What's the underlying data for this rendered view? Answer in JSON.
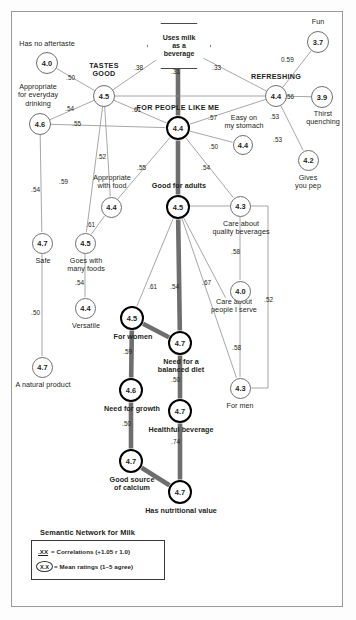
{
  "title": "Semantic Network for Milk",
  "legend": {
    "title": "Semantic Network for Milk",
    "row1_key": ".XX",
    "row1_text": "= Correlations (+1.05  r   1.0)",
    "row2_key": "X.X",
    "row2_text": "= Mean ratings (1–5 agree)"
  },
  "chart_data": {
    "type": "diagram",
    "title": "Semantic Network for Milk",
    "diagram_kind": "semantic-network",
    "value_scale": "Mean ratings (1–5 agree)",
    "edge_scale": "Correlations",
    "nodes": [
      {
        "id": "uses_milk_beverage",
        "label": "Uses milk\nas a\nbeverage",
        "value": "",
        "shape": "hexagon",
        "x": 178,
        "y": 45,
        "emphasis": "hex"
      },
      {
        "id": "has_no_aftertaste",
        "label": "Has no aftertaste",
        "value": "4.0",
        "shape": "circle",
        "x": 47,
        "y": 63,
        "emphasis": "thin",
        "label_pos": "above"
      },
      {
        "id": "tastes_good",
        "label": "TASTES\nGOOD",
        "value": "4.5",
        "shape": "circle",
        "x": 104,
        "y": 96,
        "emphasis": "thin",
        "label_pos": "above",
        "caps": true
      },
      {
        "id": "appropriate_everyday",
        "label": "Appropriate\nfor everyday\ndrinking",
        "value": "4.6",
        "shape": "circle",
        "x": 40,
        "y": 124,
        "emphasis": "thin",
        "label_pos": "above"
      },
      {
        "id": "for_people_like_me",
        "label": "FOR PEOPLE LIKE ME",
        "value": "4.4",
        "shape": "circle",
        "x": 178,
        "y": 128,
        "emphasis": "thick",
        "label_pos": "above",
        "caps": true
      },
      {
        "id": "refreshing",
        "label": "REFRESHING",
        "value": "4.4",
        "shape": "circle",
        "x": 276,
        "y": 96,
        "emphasis": "thin",
        "label_pos": "above",
        "caps": true
      },
      {
        "id": "fun",
        "label": "Fun",
        "value": "3.7",
        "shape": "circle",
        "x": 318,
        "y": 42,
        "emphasis": "thin",
        "label_pos": "above"
      },
      {
        "id": "thirst_quenching",
        "label": "Thirst\nquenching",
        "value": "3.9",
        "shape": "circle",
        "x": 322,
        "y": 97,
        "emphasis": "thin",
        "label_pos": "below"
      },
      {
        "id": "easy_on_stomach",
        "label": "Easy on\nmy stomach",
        "value": "4.4",
        "shape": "circle",
        "x": 243,
        "y": 145,
        "emphasis": "thin",
        "label_pos": "above"
      },
      {
        "id": "gives_you_pep",
        "label": "Gives\nyou pep",
        "value": "4.2",
        "shape": "circle",
        "x": 308,
        "y": 160,
        "emphasis": "thin",
        "label_pos": "below"
      },
      {
        "id": "appropriate_with_food",
        "label": "Appropriate\nwith food",
        "value": "4.4",
        "shape": "circle",
        "x": 111,
        "y": 207,
        "emphasis": "thin",
        "label_pos": "above"
      },
      {
        "id": "good_for_adults",
        "label": "Good for adults",
        "value": "4.5",
        "shape": "circle",
        "x": 178,
        "y": 207,
        "emphasis": "thick",
        "label_pos": "above"
      },
      {
        "id": "care_quality_beverages",
        "label": "Care about\nquality beverages",
        "value": "4.3",
        "shape": "circle",
        "x": 240,
        "y": 206,
        "emphasis": "thin",
        "label_pos": "below"
      },
      {
        "id": "safe",
        "label": "Safe",
        "value": "4.7",
        "shape": "circle",
        "x": 42,
        "y": 243,
        "emphasis": "thin",
        "label_pos": "below"
      },
      {
        "id": "goes_with_many_foods",
        "label": "Goes with\nmany foods",
        "value": "4.5",
        "shape": "circle",
        "x": 85,
        "y": 243,
        "emphasis": "thin",
        "label_pos": "below"
      },
      {
        "id": "versatile",
        "label": "Versatile",
        "value": "4.4",
        "shape": "circle",
        "x": 85,
        "y": 308,
        "emphasis": "thin",
        "label_pos": "below"
      },
      {
        "id": "a_natural_product",
        "label": "A natural product",
        "value": "4.7",
        "shape": "circle",
        "x": 42,
        "y": 367,
        "emphasis": "thin",
        "label_pos": "below"
      },
      {
        "id": "for_women",
        "label": "For women",
        "value": "4.5",
        "shape": "circle",
        "x": 132,
        "y": 318,
        "emphasis": "thick",
        "label_pos": "below"
      },
      {
        "id": "need_balanced_diet",
        "label": "Need for a\nbalanced diet",
        "value": "4.7",
        "shape": "circle",
        "x": 180,
        "y": 343,
        "emphasis": "thick",
        "label_pos": "below"
      },
      {
        "id": "care_people_i_serve",
        "label": "Care about\npeople I serve",
        "value": "",
        "shape": "text",
        "x": 232,
        "y": 310
      },
      {
        "id": "need_for_growth",
        "label": "Need for growth",
        "value": "4.6",
        "shape": "circle",
        "x": 131,
        "y": 390,
        "emphasis": "thick",
        "label_pos": "below"
      },
      {
        "id": "healthful_beverage",
        "label": "Healthful beverage",
        "value": "4.7",
        "shape": "circle",
        "x": 180,
        "y": 411,
        "emphasis": "thick",
        "label_pos": "below"
      },
      {
        "id": "for_men",
        "label": "For men",
        "value": "4.3",
        "shape": "circle",
        "x": 240,
        "y": 388,
        "emphasis": "thin",
        "label_pos": "below"
      },
      {
        "id": "right_4_0",
        "label": "",
        "value": "4.0",
        "shape": "circle",
        "x": 240,
        "y": 291,
        "emphasis": "thin"
      },
      {
        "id": "good_source_calcium",
        "label": "Good source\nof calcium",
        "value": "4.7",
        "shape": "circle",
        "x": 131,
        "y": 461,
        "emphasis": "thick",
        "label_pos": "below"
      },
      {
        "id": "has_nutritional_value",
        "label": "Has nutritional value",
        "value": "4.7",
        "shape": "circle",
        "x": 180,
        "y": 492,
        "emphasis": "thick",
        "label_pos": "below"
      }
    ],
    "edges": [
      {
        "from": "uses_milk_beverage",
        "to": "for_people_like_me",
        "weight": ".31",
        "style": "heavy"
      },
      {
        "from": "uses_milk_beverage",
        "to": "tastes_good",
        "weight": ".38",
        "style": "thin"
      },
      {
        "from": "uses_milk_beverage",
        "to": "refreshing",
        "weight": ".33",
        "style": "thin"
      },
      {
        "from": "has_no_aftertaste",
        "to": "tastes_good",
        "weight": ".50",
        "style": "thin"
      },
      {
        "from": "appropriate_everyday",
        "to": "tastes_good",
        "weight": ".54",
        "style": "thin"
      },
      {
        "from": "tastes_good",
        "to": "for_people_like_me",
        "weight": ".61",
        "style": "thin"
      },
      {
        "from": "appropriate_everyday",
        "to": "for_people_like_me",
        "weight": ".55",
        "style": "thin"
      },
      {
        "from": "tastes_good",
        "to": "refreshing",
        "weight": ".57",
        "style": "thin"
      },
      {
        "from": "refreshing",
        "to": "fun",
        "weight": "0.59",
        "style": "thin"
      },
      {
        "from": "refreshing",
        "to": "thirst_quenching",
        "weight": ".56",
        "style": "thin"
      },
      {
        "from": "refreshing",
        "to": "for_people_like_me",
        "weight": ".53",
        "style": "thin"
      },
      {
        "from": "refreshing",
        "to": "gives_you_pep",
        "weight": ".53",
        "style": "thin"
      },
      {
        "from": "for_people_like_me",
        "to": "easy_on_stomach",
        "weight": ".50",
        "style": "thin"
      },
      {
        "from": "for_people_like_me",
        "to": "appropriate_with_food",
        "weight": ".55",
        "style": "thin"
      },
      {
        "from": "for_people_like_me",
        "to": "good_for_adults",
        "weight": "",
        "style": "heavy"
      },
      {
        "from": "for_people_like_me",
        "to": "care_quality_beverages",
        "weight": ".54",
        "style": "thin"
      },
      {
        "from": "tastes_good",
        "to": "goes_with_many_foods",
        "weight": ".59",
        "style": "thin"
      },
      {
        "from": "tastes_good",
        "to": "appropriate_with_food",
        "weight": ".52",
        "style": "thin"
      },
      {
        "from": "appropriate_everyday",
        "to": "safe",
        "weight": ".54",
        "style": "thin"
      },
      {
        "from": "appropriate_with_food",
        "to": "goes_with_many_foods",
        "weight": ".61",
        "style": "thin"
      },
      {
        "from": "goes_with_many_foods",
        "to": "versatile",
        "weight": ".54",
        "style": "thin"
      },
      {
        "from": "safe",
        "to": "a_natural_product",
        "weight": ".50",
        "style": "thin"
      },
      {
        "from": "good_for_adults",
        "to": "for_women",
        "weight": ".61",
        "style": "thin"
      },
      {
        "from": "good_for_adults",
        "to": "need_balanced_diet",
        "weight": ".54",
        "style": "heavy"
      },
      {
        "from": "good_for_adults",
        "to": "care_people_i_serve",
        "weight": ".67",
        "style": "thin"
      },
      {
        "from": "care_quality_beverages",
        "to": "right_4_0",
        "weight": ".58",
        "style": "thin"
      },
      {
        "from": "right_4_0",
        "to": "for_men",
        "weight": ".58",
        "style": "thin"
      },
      {
        "from": "good_for_adults",
        "to": "for_men",
        "weight": ".52",
        "style": "thin"
      },
      {
        "from": "for_women",
        "to": "need_balanced_diet",
        "weight": "",
        "style": "heavy"
      },
      {
        "from": "for_women",
        "to": "need_for_growth",
        "weight": ".59",
        "style": "heavy"
      },
      {
        "from": "need_balanced_diet",
        "to": "healthful_beverage",
        "weight": ".50",
        "style": "heavy"
      },
      {
        "from": "need_for_growth",
        "to": "good_source_calcium",
        "weight": ".50",
        "style": "heavy"
      },
      {
        "from": "healthful_beverage",
        "to": "has_nutritional_value",
        "weight": ".74",
        "style": "heavy"
      },
      {
        "from": "good_source_calcium",
        "to": "has_nutritional_value",
        "weight": "",
        "style": "heavy"
      }
    ]
  },
  "nodes_text": {
    "uses_milk_beverage": "Uses milk\nas a\nbeverage",
    "has_no_aftertaste": "Has no aftertaste",
    "tastes_good": "TASTES\nGOOD",
    "appropriate_everyday": "Appropriate\nfor everyday\ndrinking",
    "for_people_like_me": "FOR PEOPLE LIKE ME",
    "refreshing": "REFRESHING",
    "fun": "Fun",
    "thirst_quenching": "Thirst\nquenching",
    "easy_on_stomach": "Easy on\nmy stomach",
    "gives_you_pep": "Gives\nyou pep",
    "appropriate_with_food": "Appropriate\nwith food",
    "good_for_adults": "Good for adults",
    "care_quality_beverages": "Care about\nquality beverages",
    "safe": "Safe",
    "goes_with_many_foods": "Goes with\nmany foods",
    "versatile": "Versatile",
    "a_natural_product": "A natural product",
    "for_women": "For women",
    "need_balanced_diet": "Need for a\nbalanced diet",
    "care_people_i_serve": "Care about\npeople I serve",
    "need_for_growth": "Need for growth",
    "healthful_beverage": "Healthful beverage",
    "for_men": "For men",
    "good_source_calcium": "Good source\nof calcium",
    "has_nutritional_value": "Has nutritional value"
  },
  "node_values": {
    "has_no_aftertaste": "4.0",
    "tastes_good": "4.5",
    "appropriate_everyday": "4.6",
    "for_people_like_me": "4.4",
    "refreshing": "4.4",
    "fun": "3.7",
    "thirst_quenching": "3.9",
    "easy_on_stomach": "4.4",
    "gives_you_pep": "4.2",
    "appropriate_with_food": "4.4",
    "good_for_adults": "4.5",
    "care_quality_beverages": "4.3",
    "safe": "4.7",
    "goes_with_many_foods": "4.5",
    "versatile": "4.4",
    "a_natural_product": "4.7",
    "for_women": "4.5",
    "need_balanced_diet": "4.7",
    "need_for_growth": "4.6",
    "healthful_beverage": "4.7",
    "for_men": "4.3",
    "right_4_0": "4.0",
    "good_source_calcium": "4.7",
    "has_nutritional_value": "4.7"
  },
  "colors": {
    "line": "#8a8a8a",
    "heavy_line": "#6e6e6e",
    "text": "#231f20",
    "frame": "#9a9a9a",
    "node_thin": "#6f6f6f",
    "node_thick": "#000000"
  }
}
